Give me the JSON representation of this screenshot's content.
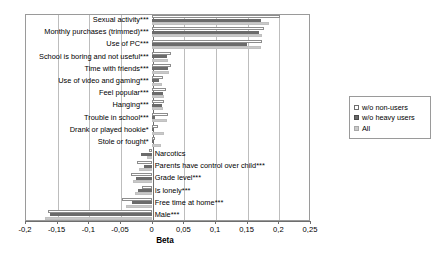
{
  "chart_data": {
    "type": "bar",
    "orientation": "horizontal",
    "title": "",
    "xlabel": "Beta",
    "ylabel": "",
    "xlim": [
      -0.2,
      0.25
    ],
    "grid": true,
    "legend_position": "right",
    "tick_labels": [
      "-0,2",
      "-0,15",
      "-0,1",
      "-0,05",
      "0",
      "0,05",
      "0,1",
      "0,15",
      "0,2",
      "0,25"
    ],
    "tick_values": [
      -0.2,
      -0.15,
      -0.1,
      -0.05,
      0,
      0.05,
      0.1,
      0.15,
      0.2,
      0.25
    ],
    "categories": [
      "Sexual activity***",
      "Monthly purchases (trimmed)***",
      "Use of PC***",
      "School is boring and not useful***",
      "Time with friends***",
      "Use of video and gaming***",
      "Feel popular***",
      "Hanging***",
      "Trouble in school***",
      "Drank or played hookie*",
      "Stole or fought*",
      "Narcotics",
      "Parents have control over child***",
      "Grade level***",
      "Is lonely***",
      "Free time at home***",
      "Male***"
    ],
    "series": [
      {
        "name": "w/o non-users",
        "values": [
          0.203,
          0.178,
          0.175,
          0.03,
          0.03,
          0.018,
          0.023,
          0.02,
          0.026,
          0.01,
          0.005,
          -0.004,
          -0.023,
          -0.033,
          -0.016,
          -0.047,
          -0.164
        ]
      },
      {
        "name": "w/o heavy users",
        "values": [
          0.172,
          0.17,
          0.15,
          0.025,
          0.026,
          0.012,
          0.018,
          0.017,
          0.006,
          0.003,
          0.004,
          -0.017,
          -0.012,
          -0.024,
          -0.022,
          -0.031,
          -0.16
        ]
      },
      {
        "name": "All",
        "values": [
          0.186,
          0.175,
          0.173,
          0.026,
          0.028,
          0.016,
          0.02,
          0.018,
          0.024,
          0.019,
          0.015,
          -0.008,
          -0.02,
          -0.03,
          -0.026,
          -0.04,
          -0.168
        ]
      }
    ]
  },
  "legend": {
    "items": [
      {
        "label": "w/o non-users",
        "swatch": "white-square"
      },
      {
        "label": "w/o heavy users",
        "swatch": "dark-gray-square"
      },
      {
        "label": "All",
        "swatch": "light-gray-square"
      }
    ]
  },
  "axis": {
    "title": "Beta"
  }
}
